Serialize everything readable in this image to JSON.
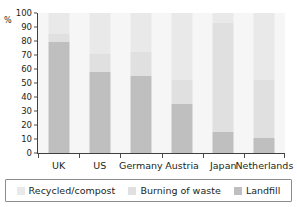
{
  "chart_data": {
    "type": "bar",
    "subtype": "stacked-100-percent",
    "title": "",
    "xlabel": "",
    "ylabel": "%",
    "ylim": [
      0,
      100
    ],
    "yticks": [
      0,
      10,
      20,
      30,
      40,
      50,
      60,
      70,
      80,
      90,
      100
    ],
    "ytick_labels": [
      "0",
      "10",
      "20",
      "30",
      "40",
      "50",
      "60",
      "70",
      "80",
      "90",
      "100"
    ],
    "grid": false,
    "legend_position": "bottom",
    "categories": [
      "UK",
      "US",
      "Germany",
      "Austria",
      "Japan",
      "Netherlands"
    ],
    "series": [
      {
        "name": "Recycled/compost",
        "color": "#e9e9e9",
        "values": [
          15,
          29,
          28,
          48,
          7,
          48
        ]
      },
      {
        "name": "Burning of waste",
        "color": "#e0e0e0",
        "values": [
          6,
          13,
          17,
          17,
          78,
          41
        ]
      },
      {
        "name": "Landfill",
        "color": "#bfbfbf",
        "values": [
          79,
          58,
          55,
          35,
          15,
          11
        ]
      }
    ],
    "stack_tops": {
      "landfill": [
        79,
        58,
        55,
        35,
        15,
        11
      ],
      "burning_cumulative": [
        85,
        71,
        72,
        52,
        93,
        52
      ],
      "recycled_cumulative": [
        100,
        100,
        100,
        100,
        100,
        100
      ]
    },
    "stack_order_bottom_to_top": [
      "Landfill",
      "Burning of waste",
      "Recycled/compost"
    ]
  },
  "legend": {
    "items": [
      {
        "label": "Recycled/compost",
        "color": "#e9e9e9"
      },
      {
        "label": "Burning of waste",
        "color": "#e0e0e0"
      },
      {
        "label": "Landfill",
        "color": "#bfbfbf"
      }
    ]
  },
  "colors": {
    "axis": "#3f3f3f",
    "text": "#231f20",
    "plot_background": "#f6f6f6",
    "legend_border": "#8c8c8c",
    "page_background": "#ffffff"
  }
}
